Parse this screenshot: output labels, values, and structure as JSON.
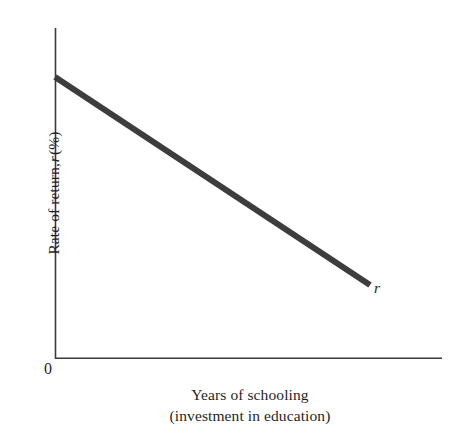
{
  "chart_data": {
    "type": "line",
    "title": "",
    "subtitle": "",
    "xlabel_line1": "Years of schooling",
    "xlabel_line2": "(investment in education)",
    "ylabel_prefix": "Rate of return, ",
    "ylabel_variable": "r",
    "ylabel_suffix": " (%)",
    "origin_label": "0",
    "grid": false,
    "legend_position": "inline-end-of-line",
    "xlim": [
      0,
      100
    ],
    "ylim": [
      0,
      100
    ],
    "x_ticks": [],
    "y_ticks": [],
    "series": [
      {
        "name": "r",
        "annotation": "r",
        "annotation_style": "italic",
        "color": "#3d3d3d",
        "linewidth_px": 6,
        "x": [
          0,
          81.4
        ],
        "y": [
          85.2,
          22.1
        ],
        "points_px": [
          {
            "x": 55,
            "y": 77
          },
          {
            "x": 370,
            "y": 285
          }
        ],
        "description": "Downward-sloping straight line: rate of return to education falls as years of schooling increase."
      }
    ]
  },
  "axes": {
    "y_axis": {
      "x_px": 55,
      "y_top_px": 28,
      "y_bottom_px": 358,
      "color": "#3a3a3a"
    },
    "x_axis": {
      "y_px": 358,
      "x_left_px": 55,
      "x_right_px": 442,
      "color": "#3a3a3a"
    }
  },
  "colors": {
    "background": "#ffffff",
    "axis": "#3a3a3a",
    "line": "#3d3d3d",
    "text": "#1f1f1f"
  }
}
